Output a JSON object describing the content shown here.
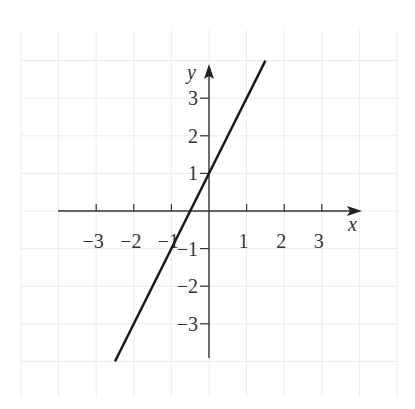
{
  "chart_data": {
    "type": "line",
    "title": "",
    "xlabel": "x",
    "ylabel": "y",
    "xlim": [
      -4,
      4
    ],
    "ylim": [
      -4,
      4
    ],
    "grid": true,
    "legend": null,
    "x_ticks": [
      -3,
      -2,
      -1,
      1,
      2,
      3
    ],
    "y_ticks": [
      3,
      2,
      1,
      -1,
      -2,
      -3
    ],
    "x_tick_labels": [
      "−3",
      "−2",
      "−1",
      "1",
      "2",
      "3"
    ],
    "y_tick_labels": [
      "3",
      "2",
      "1",
      "−1",
      "−2",
      "−3"
    ],
    "series": [
      {
        "name": "y = 2x + 1",
        "x": [
          -2.5,
          1.5
        ],
        "y": [
          -4,
          4
        ],
        "color": "#1a1a1a"
      }
    ]
  },
  "style": {
    "grid_color": "#ececec",
    "axis_color": "#333333",
    "line_color": "#1a1a1a"
  }
}
